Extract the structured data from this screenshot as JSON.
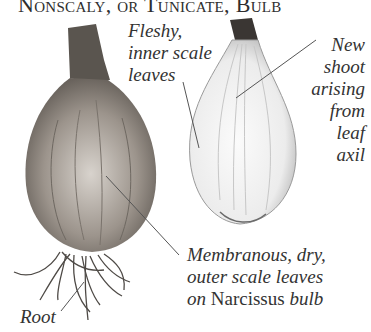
{
  "title": "Nonscaly, or Tunicate, Bulb",
  "labels": {
    "fleshy": [
      "Fleshy,",
      "inner scale",
      "leaves"
    ],
    "new_shoot": [
      "New",
      "shoot",
      "arising",
      "from",
      "leaf",
      "axil"
    ],
    "membranous": {
      "line1": "Membranous, dry,",
      "line2": "outer scale leaves",
      "line3_pre": "on ",
      "line3_genus": "Narcissus",
      "line3_post": " bulb"
    },
    "root": "Root"
  },
  "figures": [
    {
      "name": "whole-bulb",
      "description": "Whole Narcissus bulb with papery tunic and roots"
    },
    {
      "name": "sectioned-bulb",
      "description": "Longitudinal section showing fleshy inner scale leaves"
    }
  ],
  "colors": {
    "background": "#ffffff",
    "text": "#333333",
    "leader_line": "#555555"
  }
}
